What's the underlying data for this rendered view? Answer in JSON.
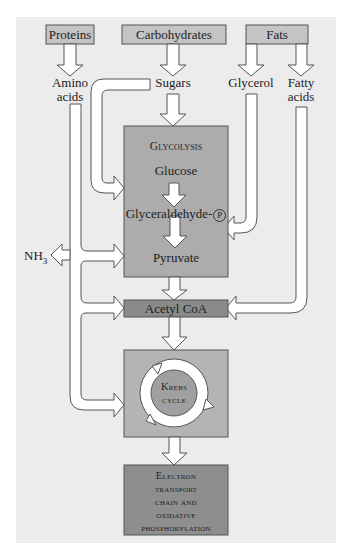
{
  "diagram": {
    "sources": {
      "proteins": "Proteins",
      "carbohydrates": "Carbohydrates",
      "fats": "Fats"
    },
    "intermediates": {
      "amino_line1": "Amino",
      "amino_line2": "acids",
      "sugars": "Sugars",
      "glycerol": "Glycerol",
      "fatty_line1": "Fatty",
      "fatty_line2": "acids",
      "nh3": "NH",
      "nh3_sub": "3"
    },
    "glycolysis": {
      "title": "Glycolysis",
      "glucose": "Glucose",
      "glyceraldehyde": "Glyceraldehyde-",
      "phosphate_symbol": "P",
      "pyruvate": "Pyruvate"
    },
    "acetyl_coa": "Acetyl CoA",
    "krebs": {
      "line1": "Krebs",
      "line2": "cycle"
    },
    "etc": {
      "line1": "Electron",
      "line2": "transport",
      "line3": "chain and",
      "line4": "oxidative",
      "line5": "phosphorylation"
    },
    "colors": {
      "panel": "#ececec",
      "source_box": "#c4c4c4",
      "glycolysis_box": "#acacac",
      "acetyl_box": "#8a8a8a",
      "krebs_box": "#b4b4b4",
      "krebs_inner": "#a0a0a0",
      "etc_box": "#8e8e8e",
      "arrow_fill": "#ffffff",
      "stroke": "#555555"
    }
  }
}
